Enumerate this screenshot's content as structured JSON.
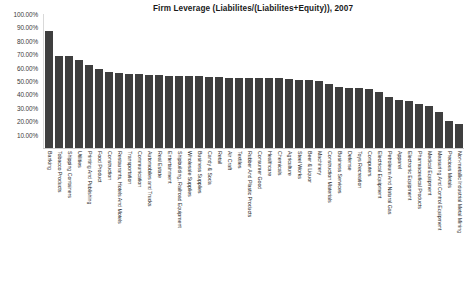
{
  "chart_data": {
    "type": "bar",
    "title": "Firm Leverage (Liabilites/(Liabilites+Equity)), 2007",
    "xlabel": "",
    "ylabel": "",
    "ylim": [
      0,
      100
    ],
    "ytick_labels": [
      "100.00%",
      "90.00%",
      "80.00%",
      "70.00%",
      "60.00%",
      "50.00%",
      "40.00%",
      "30.00%",
      "20.00%",
      "10.00%",
      "0.00%"
    ],
    "ytick_values": [
      100,
      90,
      80,
      70,
      60,
      50,
      40,
      30,
      20,
      10,
      0
    ],
    "grid": false,
    "legend": false,
    "bar_color": "#3f3f3f",
    "categories": [
      "Banking",
      "Tobacco Products",
      "Shipping Containers",
      "Utilities",
      "Printing And Publishing",
      "Food Product",
      "Construction",
      "Restaurants, Hotels And Motels",
      "Transportation",
      "Communication",
      "Automobiles and Trucks",
      "Real Estate",
      "Entertainment",
      "Shipbuilding, Railroad Equipment",
      "Wholesale Supplies",
      "Business Supplies",
      "Candy & Soda",
      "Retail",
      "Air Craft",
      "Textiles",
      "Rubber And Plastic Products",
      "Consumer Good",
      "Healthcare",
      "Chemicals",
      "Agriculture",
      "Steel Works",
      "Beer & Liquor",
      "Machinery",
      "Construction Materials",
      "Business Services",
      "Defense",
      "Toys Recreation",
      "Computers",
      "Electrical Equipment",
      "Petroleum And Natural Gas",
      "Apparel",
      "Electronic Equipment",
      "Pharmaceutical Products",
      "Medical Equipment",
      "Measuring And Control Equipment",
      "Precious Metals",
      "Non-metallic Industrial Metal Mining"
    ],
    "values": [
      87.0,
      69.0,
      69.0,
      66.0,
      62.0,
      59.0,
      57.0,
      56.0,
      55.5,
      55.0,
      54.5,
      54.5,
      54.0,
      54.0,
      53.5,
      53.5,
      53.0,
      53.0,
      52.5,
      52.5,
      52.5,
      52.0,
      52.0,
      52.0,
      51.5,
      51.0,
      50.5,
      50.0,
      47.5,
      45.5,
      45.0,
      44.5,
      44.0,
      42.0,
      38.0,
      36.0,
      35.0,
      33.0,
      31.0,
      27.0,
      20.0,
      18.0
    ]
  }
}
